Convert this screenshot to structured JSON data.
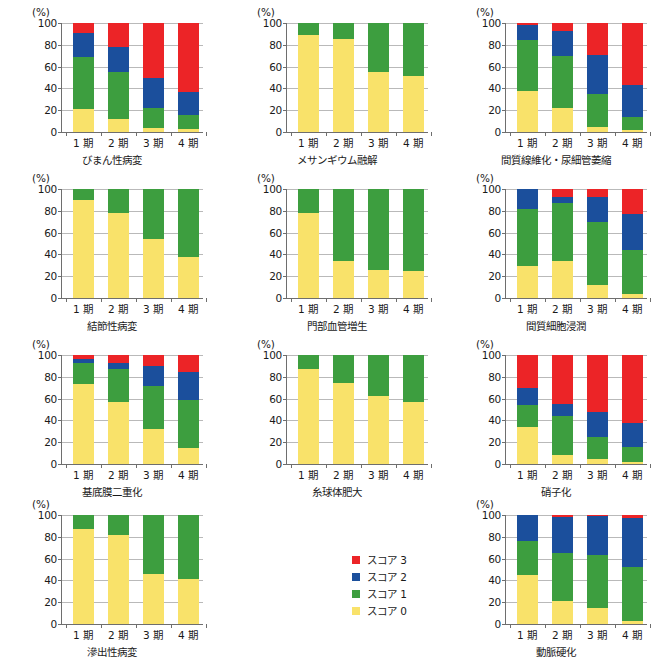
{
  "axis": {
    "unit_label": "(%)",
    "yticks": [
      0,
      20,
      40,
      60,
      80,
      100
    ],
    "ylim": [
      0,
      100
    ],
    "categories": [
      "1 期",
      "2 期",
      "3 期",
      "4 期"
    ]
  },
  "legend": {
    "position": "bottom-center",
    "items": [
      {
        "label": "スコア 3",
        "color": "#ec2427"
      },
      {
        "label": "スコア 2",
        "color": "#1b4f9c"
      },
      {
        "label": "スコア 1",
        "color": "#3d9e3f"
      },
      {
        "label": "スコア 0",
        "color": "#f9e26a"
      }
    ]
  },
  "colors": {
    "score3": "#ec2427",
    "score2": "#1b4f9c",
    "score1": "#3d9e3f",
    "score0": "#f9e26a",
    "gridline": "#b9b9b9",
    "axis": "#6e6e6e",
    "text": "#1a1a1a",
    "background": "#ffffff"
  },
  "chart_data": [
    {
      "type": "bar",
      "stacked": true,
      "title": "びまん性病変",
      "xlabel": "",
      "ylabel": "(%)",
      "ylim": [
        0,
        100
      ],
      "grid": true,
      "categories": [
        "1 期",
        "2 期",
        "3 期",
        "4 期"
      ],
      "series": [
        {
          "name": "スコア 0",
          "color": "#f9e26a",
          "values": [
            21,
            12,
            4,
            3
          ]
        },
        {
          "name": "スコア 1",
          "color": "#3d9e3f",
          "values": [
            48,
            43,
            18,
            13
          ]
        },
        {
          "name": "スコア 2",
          "color": "#1b4f9c",
          "values": [
            22,
            23,
            28,
            21
          ]
        },
        {
          "name": "スコア 3",
          "color": "#ec2427",
          "values": [
            9,
            22,
            50,
            63
          ]
        }
      ]
    },
    {
      "type": "bar",
      "stacked": true,
      "title": "メサンギウム融解",
      "xlabel": "",
      "ylabel": "(%)",
      "ylim": [
        0,
        100
      ],
      "grid": true,
      "categories": [
        "1 期",
        "2 期",
        "3 期",
        "4 期"
      ],
      "series": [
        {
          "name": "スコア 0",
          "color": "#f9e26a",
          "values": [
            89,
            85,
            55,
            51
          ]
        },
        {
          "name": "スコア 1",
          "color": "#3d9e3f",
          "values": [
            11,
            15,
            45,
            49
          ]
        },
        {
          "name": "スコア 2",
          "color": "#1b4f9c",
          "values": [
            0,
            0,
            0,
            0
          ]
        },
        {
          "name": "スコア 3",
          "color": "#ec2427",
          "values": [
            0,
            0,
            0,
            0
          ]
        }
      ]
    },
    {
      "type": "bar",
      "stacked": true,
      "title": "間質線維化・尿細管萎縮",
      "xlabel": "",
      "ylabel": "(%)",
      "ylim": [
        0,
        100
      ],
      "grid": true,
      "categories": [
        "1 期",
        "2 期",
        "3 期",
        "4 期"
      ],
      "series": [
        {
          "name": "スコア 0",
          "color": "#f9e26a",
          "values": [
            38,
            22,
            5,
            2
          ]
        },
        {
          "name": "スコア 1",
          "color": "#3d9e3f",
          "values": [
            46,
            48,
            30,
            12
          ]
        },
        {
          "name": "スコア 2",
          "color": "#1b4f9c",
          "values": [
            14,
            23,
            36,
            29
          ]
        },
        {
          "name": "スコア 3",
          "color": "#ec2427",
          "values": [
            2,
            7,
            29,
            57
          ]
        }
      ]
    },
    {
      "type": "bar",
      "stacked": true,
      "title": "結節性病変",
      "xlabel": "",
      "ylabel": "(%)",
      "ylim": [
        0,
        100
      ],
      "grid": true,
      "categories": [
        "1 期",
        "2 期",
        "3 期",
        "4 期"
      ],
      "series": [
        {
          "name": "スコア 0",
          "color": "#f9e26a",
          "values": [
            90,
            78,
            54,
            38
          ]
        },
        {
          "name": "スコア 1",
          "color": "#3d9e3f",
          "values": [
            10,
            22,
            46,
            62
          ]
        },
        {
          "name": "スコア 2",
          "color": "#1b4f9c",
          "values": [
            0,
            0,
            0,
            0
          ]
        },
        {
          "name": "スコア 3",
          "color": "#ec2427",
          "values": [
            0,
            0,
            0,
            0
          ]
        }
      ]
    },
    {
      "type": "bar",
      "stacked": true,
      "title": "門部血管増生",
      "xlabel": "",
      "ylabel": "(%)",
      "ylim": [
        0,
        100
      ],
      "grid": true,
      "categories": [
        "1 期",
        "2 期",
        "3 期",
        "4 期"
      ],
      "series": [
        {
          "name": "スコア 0",
          "color": "#f9e26a",
          "values": [
            78,
            34,
            26,
            25
          ]
        },
        {
          "name": "スコア 1",
          "color": "#3d9e3f",
          "values": [
            22,
            66,
            74,
            75
          ]
        },
        {
          "name": "スコア 2",
          "color": "#1b4f9c",
          "values": [
            0,
            0,
            0,
            0
          ]
        },
        {
          "name": "スコア 3",
          "color": "#ec2427",
          "values": [
            0,
            0,
            0,
            0
          ]
        }
      ]
    },
    {
      "type": "bar",
      "stacked": true,
      "title": "間質細胞浸潤",
      "xlabel": "",
      "ylabel": "(%)",
      "ylim": [
        0,
        100
      ],
      "grid": true,
      "categories": [
        "1 期",
        "2 期",
        "3 期",
        "4 期"
      ],
      "series": [
        {
          "name": "スコア 0",
          "color": "#f9e26a",
          "values": [
            29,
            34,
            12,
            4
          ]
        },
        {
          "name": "スコア 1",
          "color": "#3d9e3f",
          "values": [
            53,
            53,
            58,
            40
          ]
        },
        {
          "name": "スコア 2",
          "color": "#1b4f9c",
          "values": [
            18,
            6,
            23,
            33
          ]
        },
        {
          "name": "スコア 3",
          "color": "#ec2427",
          "values": [
            0,
            7,
            7,
            23
          ]
        }
      ]
    },
    {
      "type": "bar",
      "stacked": true,
      "title": "基底膜二重化",
      "xlabel": "",
      "ylabel": "(%)",
      "ylim": [
        0,
        100
      ],
      "grid": true,
      "categories": [
        "1 期",
        "2 期",
        "3 期",
        "4 期"
      ],
      "series": [
        {
          "name": "スコア 0",
          "color": "#f9e26a",
          "values": [
            73,
            57,
            32,
            15
          ]
        },
        {
          "name": "スコア 1",
          "color": "#3d9e3f",
          "values": [
            20,
            30,
            40,
            44
          ]
        },
        {
          "name": "スコア 2",
          "color": "#1b4f9c",
          "values": [
            3,
            6,
            18,
            25
          ]
        },
        {
          "name": "スコア 3",
          "color": "#ec2427",
          "values": [
            4,
            7,
            10,
            16
          ]
        }
      ]
    },
    {
      "type": "bar",
      "stacked": true,
      "title": "糸球体肥大",
      "xlabel": "",
      "ylabel": "(%)",
      "ylim": [
        0,
        100
      ],
      "grid": true,
      "categories": [
        "1 期",
        "2 期",
        "3 期",
        "4 期"
      ],
      "series": [
        {
          "name": "スコア 0",
          "color": "#f9e26a",
          "values": [
            87,
            74,
            62,
            57
          ]
        },
        {
          "name": "スコア 1",
          "color": "#3d9e3f",
          "values": [
            13,
            26,
            38,
            43
          ]
        },
        {
          "name": "スコア 2",
          "color": "#1b4f9c",
          "values": [
            0,
            0,
            0,
            0
          ]
        },
        {
          "name": "スコア 3",
          "color": "#ec2427",
          "values": [
            0,
            0,
            0,
            0
          ]
        }
      ]
    },
    {
      "type": "bar",
      "stacked": true,
      "title": "硝子化",
      "xlabel": "",
      "ylabel": "(%)",
      "ylim": [
        0,
        100
      ],
      "grid": true,
      "categories": [
        "1 期",
        "2 期",
        "3 期",
        "4 期"
      ],
      "series": [
        {
          "name": "スコア 0",
          "color": "#f9e26a",
          "values": [
            34,
            8,
            5,
            2
          ]
        },
        {
          "name": "スコア 1",
          "color": "#3d9e3f",
          "values": [
            20,
            36,
            20,
            14
          ]
        },
        {
          "name": "スコア 2",
          "color": "#1b4f9c",
          "values": [
            16,
            11,
            23,
            22
          ]
        },
        {
          "name": "スコア 3",
          "color": "#ec2427",
          "values": [
            30,
            45,
            52,
            62
          ]
        }
      ]
    },
    {
      "type": "bar",
      "stacked": true,
      "title": "滲出性病変",
      "xlabel": "",
      "ylabel": "(%)",
      "ylim": [
        0,
        100
      ],
      "grid": true,
      "categories": [
        "1 期",
        "2 期",
        "3 期",
        "4 期"
      ],
      "series": [
        {
          "name": "スコア 0",
          "color": "#f9e26a",
          "values": [
            87,
            82,
            46,
            41
          ]
        },
        {
          "name": "スコア 1",
          "color": "#3d9e3f",
          "values": [
            13,
            18,
            54,
            59
          ]
        },
        {
          "name": "スコア 2",
          "color": "#1b4f9c",
          "values": [
            0,
            0,
            0,
            0
          ]
        },
        {
          "name": "スコア 3",
          "color": "#ec2427",
          "values": [
            0,
            0,
            0,
            0
          ]
        }
      ]
    },
    {
      "type": "bar",
      "stacked": true,
      "title": "動脈硬化",
      "xlabel": "",
      "ylabel": "(%)",
      "ylim": [
        0,
        100
      ],
      "grid": true,
      "categories": [
        "1 期",
        "2 期",
        "3 期",
        "4 期"
      ],
      "series": [
        {
          "name": "スコア 0",
          "color": "#f9e26a",
          "values": [
            45,
            21,
            15,
            3
          ]
        },
        {
          "name": "スコア 1",
          "color": "#3d9e3f",
          "values": [
            31,
            44,
            48,
            49
          ]
        },
        {
          "name": "スコア 2",
          "color": "#1b4f9c",
          "values": [
            24,
            33,
            36,
            45
          ]
        },
        {
          "name": "スコア 3",
          "color": "#ec2427",
          "values": [
            0,
            2,
            1,
            3
          ]
        }
      ]
    }
  ]
}
